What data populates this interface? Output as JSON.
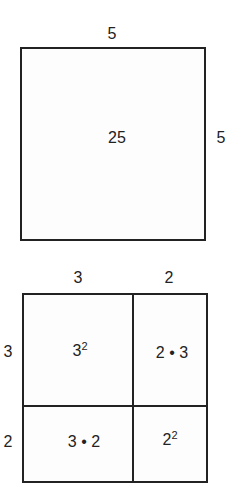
{
  "square": {
    "top_label": "5",
    "side_label": "5",
    "area": "25"
  },
  "expanded": {
    "top_labels": [
      "3",
      "2"
    ],
    "side_labels": [
      "3",
      "2"
    ],
    "cells": {
      "top_left_base": "3",
      "top_left_exp": "2",
      "top_right": "2 • 3",
      "bottom_left": "3 • 2",
      "bottom_right_base": "2",
      "bottom_right_exp": "2"
    }
  }
}
